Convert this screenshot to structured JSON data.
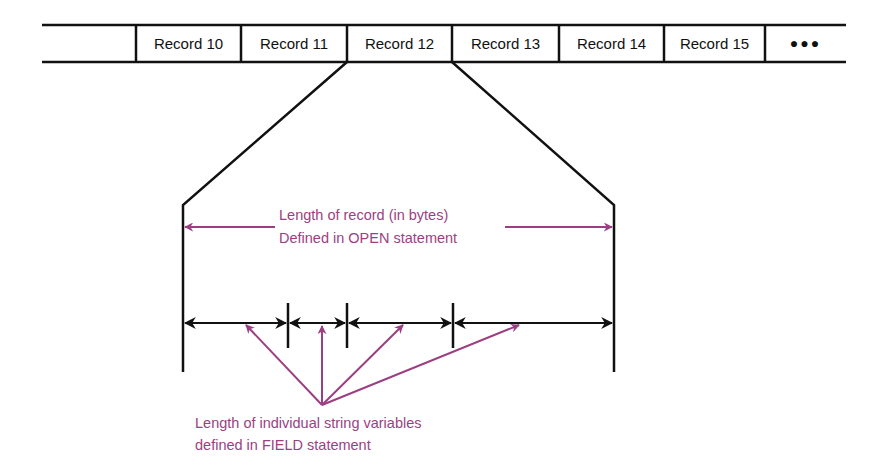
{
  "diagram": {
    "records": [
      {
        "label": "",
        "x1": 42,
        "x2": 136
      },
      {
        "label": "Record 10",
        "x1": 136,
        "x2": 241
      },
      {
        "label": "Record 11",
        "x1": 241,
        "x2": 347
      },
      {
        "label": "Record 12",
        "x1": 347,
        "x2": 452
      },
      {
        "label": "Record 13",
        "x1": 452,
        "x2": 559
      },
      {
        "label": "Record 14",
        "x1": 559,
        "x2": 664
      },
      {
        "label": "Record 15",
        "x1": 664,
        "x2": 765
      },
      {
        "label": "●●●",
        "x1": 765,
        "x2": 846
      }
    ],
    "expanded_record": "Record 12",
    "record_length_label": {
      "line1": "Length of record (in bytes)",
      "line2": "Defined in OPEN statement"
    },
    "field_length_label": {
      "line1": "Length of individual string variables",
      "line2": "defined in FIELD statement"
    },
    "field_boundaries_x": [
      183,
      288,
      347,
      453,
      614
    ],
    "colors": {
      "line": "#111111",
      "annotation": "#9b3f82",
      "background": "#ffffff"
    }
  }
}
